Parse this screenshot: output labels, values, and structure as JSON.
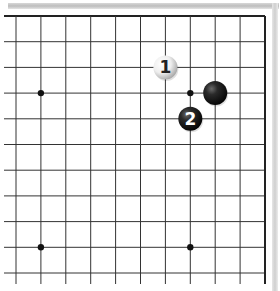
{
  "board": {
    "size_visible": "top-right corner section",
    "grid_origin": {
      "x": 16,
      "y": 16
    },
    "spacing": {
      "x": 24.9,
      "y": 25.7
    },
    "columns": 11,
    "rows": 11,
    "line_color": "#333333",
    "border_color": "#222222",
    "background": "#ffffff"
  },
  "star_points": [
    {
      "col": 1,
      "row": 3
    },
    {
      "col": 7,
      "row": 3
    },
    {
      "col": 1,
      "row": 9
    },
    {
      "col": 7,
      "row": 9
    }
  ],
  "stones": [
    {
      "color": "white",
      "col": 6,
      "row": 2,
      "label": "1"
    },
    {
      "color": "black",
      "col": 8,
      "row": 3,
      "label": ""
    },
    {
      "color": "black",
      "col": 7,
      "row": 4,
      "label": "2"
    }
  ]
}
